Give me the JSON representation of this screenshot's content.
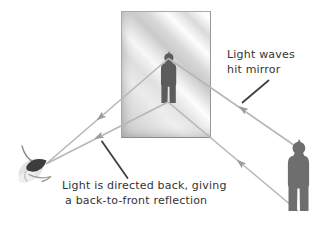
{
  "colors": {
    "bg": "#ffffff",
    "ray": "#b7b7b7",
    "arrow": "#9c9c9c",
    "leader": "#3f3f3f",
    "text": "#333333",
    "figure": "#6e6e6e",
    "figure2": "#5c5c5c",
    "frame": "#a9a9a9",
    "eyedark": "#3c3c3c"
  },
  "annotations": {
    "light_waves": {
      "line1": "Light waves",
      "line2": "hit mirror"
    },
    "directed_back": {
      "line1": "Light is directed back, giving",
      "line2": "a back-to-front reflection"
    }
  }
}
